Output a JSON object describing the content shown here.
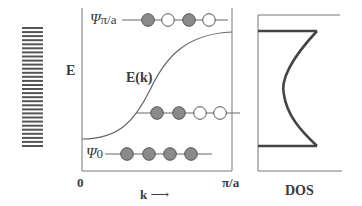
{
  "diagram": {
    "type": "band-structure-schematic",
    "panels": {
      "levels": {
        "description": "stack of discrete energy levels forming a band",
        "line_count": 30
      },
      "dispersion": {
        "y_axis_label": "E",
        "x_axis_label": "k",
        "x_axis_arrow": "⟶",
        "x_tick_start": "0",
        "x_tick_end": "π/a",
        "curve_label": "E(k)",
        "states": [
          {
            "label_main": "Ψ",
            "label_sub": "π/a",
            "position": "top",
            "orbitals": [
              "filled",
              "empty",
              "filled",
              "empty"
            ]
          },
          {
            "label_main": "",
            "label_sub": "",
            "position": "middle",
            "orbitals": [
              "filled",
              "filled",
              "empty",
              "empty"
            ]
          },
          {
            "label_main": "Ψ",
            "label_sub": "0",
            "position": "bottom",
            "orbitals": [
              "filled",
              "filled",
              "filled",
              "filled"
            ]
          }
        ]
      },
      "dos": {
        "x_axis_label": "DOS"
      }
    },
    "colors": {
      "line": "#555555",
      "thick_line": "#444444",
      "filled_orbital": "#8a8a8a",
      "empty_orbital": "#ffffff",
      "text": "#3a3a3a"
    }
  }
}
